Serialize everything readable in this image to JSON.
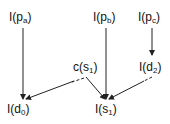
{
  "nodes": {
    "pa": {
      "fn": "I(",
      "base": "p",
      "sub": "a",
      "close": ")"
    },
    "pb": {
      "fn": "I(",
      "base": "p",
      "sub": "b",
      "close": ")"
    },
    "pc": {
      "fn": "I(",
      "base": "p",
      "sub": "c",
      "close": ")"
    },
    "cs1": {
      "fn": "c(",
      "base": "s",
      "sub": "1",
      "close": ")"
    },
    "d2": {
      "fn": "I(",
      "base": "d",
      "sub": "2",
      "close": ")"
    },
    "d0": {
      "fn": "I(",
      "base": "d",
      "sub": "0",
      "close": ")"
    },
    "s1": {
      "fn": "I(",
      "base": "s",
      "sub": "1",
      "close": ")"
    }
  },
  "edges": [
    {
      "from": "I(pa)",
      "to": "I(d0)",
      "style": "solid"
    },
    {
      "from": "I(pb)",
      "to": "I(s1)",
      "style": "solid"
    },
    {
      "from": "I(pc)",
      "to": "I(d2)",
      "style": "solid"
    },
    {
      "from": "c(s1)",
      "to": "I(d0)",
      "style": "dashed-start"
    },
    {
      "from": "c(s1)",
      "to": "I(s1)",
      "style": "dashed-start"
    },
    {
      "from": "I(d2)",
      "to": "I(s1)",
      "style": "dashed-start"
    }
  ]
}
